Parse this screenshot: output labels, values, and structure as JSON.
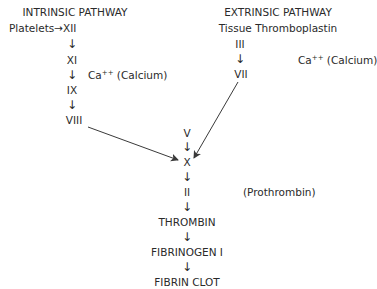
{
  "diagram": {
    "title_type": "coagulation cascade",
    "intrinsic": {
      "heading": "INTRINSIC PATHWAY",
      "start_label": "Platelets",
      "start_arrow": "→",
      "factors": [
        "XII",
        "XI",
        "IX",
        "VIII"
      ],
      "cofactor": {
        "label": "Ca",
        "superscript": "++",
        "suffix": "(Calcium)"
      }
    },
    "extrinsic": {
      "heading": "EXTRINSIC PATHWAY",
      "start_label": "Tissue Thromboplastin",
      "factors": [
        "III",
        "VII"
      ],
      "cofactor": {
        "label": "Ca",
        "superscript": "++",
        "suffix": "(Calcium)"
      }
    },
    "common": {
      "factors": [
        "V",
        "X",
        "II"
      ],
      "prothrombin_note": "(Prothrombin)",
      "products": [
        "THROMBIN",
        "FIBRINOGEN I",
        "FIBRIN CLOT"
      ]
    },
    "down_arrow": "↓",
    "colors": {
      "text": "#2a2a2a",
      "lines": "#3a3a3a",
      "background": "#ffffff"
    }
  }
}
